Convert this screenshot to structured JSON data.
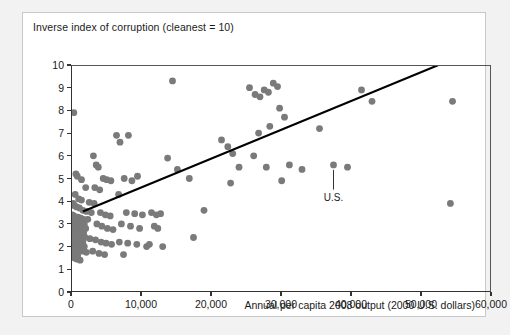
{
  "figure": {
    "title": "Inverse index of corruption (cleanest = 10)",
    "x_axis_title": "Annual per capita 2008 output (2000 U.S. dollars)"
  },
  "annotations": [
    {
      "label": "U.S.",
      "x": 37500,
      "y": 4.6,
      "point_x": 37500,
      "point_y": 5.6
    }
  ],
  "chart_data": {
    "type": "scatter",
    "title": "Inverse index of corruption (cleanest = 10)",
    "xlabel": "Annual per capita 2008 output (2000 U.S. dollars)",
    "ylabel": "Inverse index of corruption (cleanest = 10)",
    "xlim": [
      0,
      60000
    ],
    "ylim": [
      0,
      10
    ],
    "xticks": [
      0,
      10000,
      20000,
      30000,
      40000,
      50000,
      60000
    ],
    "xticklabels": [
      "0",
      "10,000",
      "20,000",
      "30,000",
      "40,000",
      "50,000",
      "60,000"
    ],
    "yticks": [
      0,
      1,
      2,
      3,
      4,
      5,
      6,
      7,
      8,
      9,
      10
    ],
    "yticklabels": [
      "0",
      "1",
      "2",
      "3",
      "4",
      "5",
      "6",
      "7",
      "8",
      "9",
      "10"
    ],
    "grid": false,
    "legend": false,
    "marker_color": "#7a7a7a",
    "marker_size": 3.4,
    "trendline": {
      "color": "#000000",
      "width": 2.1,
      "x0": 1700,
      "y0": 3.55,
      "x1": 52500,
      "y1": 10.0
    },
    "points": [
      [
        400,
        7.9
      ],
      [
        700,
        5.2
      ],
      [
        900,
        5.1
      ],
      [
        1500,
        4.95
      ],
      [
        2100,
        4.6
      ],
      [
        600,
        4.3
      ],
      [
        1100,
        4.1
      ],
      [
        1500,
        4.05
      ],
      [
        2600,
        3.95
      ],
      [
        300,
        3.9
      ],
      [
        500,
        3.8
      ],
      [
        800,
        3.75
      ],
      [
        1200,
        3.7
      ],
      [
        1700,
        3.6
      ],
      [
        2200,
        3.55
      ],
      [
        2900,
        3.5
      ],
      [
        200,
        3.4
      ],
      [
        400,
        3.35
      ],
      [
        700,
        3.3
      ],
      [
        1000,
        3.3
      ],
      [
        1400,
        3.25
      ],
      [
        1800,
        3.2
      ],
      [
        2400,
        3.2
      ],
      [
        300,
        3.1
      ],
      [
        600,
        3.1
      ],
      [
        900,
        3.05
      ],
      [
        1300,
        3.0
      ],
      [
        1900,
        3.0
      ],
      [
        250,
        2.95
      ],
      [
        550,
        2.9
      ],
      [
        800,
        2.9
      ],
      [
        1100,
        2.85
      ],
      [
        1600,
        2.8
      ],
      [
        2100,
        2.8
      ],
      [
        350,
        2.75
      ],
      [
        650,
        2.7
      ],
      [
        950,
        2.7
      ],
      [
        1250,
        2.65
      ],
      [
        1800,
        2.6
      ],
      [
        200,
        2.55
      ],
      [
        500,
        2.5
      ],
      [
        750,
        2.5
      ],
      [
        1050,
        2.45
      ],
      [
        1500,
        2.4
      ],
      [
        2000,
        2.4
      ],
      [
        2700,
        2.35
      ],
      [
        300,
        2.3
      ],
      [
        600,
        2.3
      ],
      [
        900,
        2.25
      ],
      [
        1200,
        2.2
      ],
      [
        1700,
        2.2
      ],
      [
        400,
        2.15
      ],
      [
        700,
        2.1
      ],
      [
        1000,
        2.1
      ],
      [
        1400,
        2.05
      ],
      [
        1900,
        2.0
      ],
      [
        250,
        1.95
      ],
      [
        550,
        1.9
      ],
      [
        850,
        1.9
      ],
      [
        1150,
        1.85
      ],
      [
        1600,
        1.8
      ],
      [
        2200,
        1.75
      ],
      [
        350,
        1.7
      ],
      [
        650,
        1.65
      ],
      [
        950,
        1.6
      ],
      [
        500,
        1.5
      ],
      [
        800,
        1.45
      ],
      [
        1300,
        1.4
      ],
      [
        3200,
        6.0
      ],
      [
        3600,
        5.6
      ],
      [
        3900,
        5.5
      ],
      [
        4600,
        5.0
      ],
      [
        5100,
        4.95
      ],
      [
        5700,
        4.9
      ],
      [
        3400,
        4.6
      ],
      [
        4100,
        4.5
      ],
      [
        3300,
        3.9
      ],
      [
        4200,
        3.5
      ],
      [
        4900,
        3.4
      ],
      [
        5600,
        3.35
      ],
      [
        3700,
        3.0
      ],
      [
        4400,
        2.9
      ],
      [
        5200,
        2.8
      ],
      [
        6000,
        2.75
      ],
      [
        3500,
        2.3
      ],
      [
        4300,
        2.2
      ],
      [
        5000,
        2.15
      ],
      [
        5800,
        2.1
      ],
      [
        3100,
        1.8
      ],
      [
        4000,
        1.7
      ],
      [
        4800,
        1.65
      ],
      [
        6500,
        6.9
      ],
      [
        7000,
        6.6
      ],
      [
        8200,
        6.9
      ],
      [
        7600,
        5.0
      ],
      [
        8700,
        4.9
      ],
      [
        9500,
        5.1
      ],
      [
        6800,
        4.3
      ],
      [
        7900,
        3.5
      ],
      [
        9100,
        3.45
      ],
      [
        10200,
        3.4
      ],
      [
        7200,
        3.0
      ],
      [
        8500,
        2.9
      ],
      [
        9800,
        2.8
      ],
      [
        6900,
        2.2
      ],
      [
        8100,
        2.15
      ],
      [
        9400,
        2.1
      ],
      [
        10800,
        2.0
      ],
      [
        7500,
        1.65
      ],
      [
        11500,
        3.5
      ],
      [
        12200,
        3.4
      ],
      [
        12800,
        3.45
      ],
      [
        11900,
        2.9
      ],
      [
        12400,
        2.8
      ],
      [
        11200,
        2.1
      ],
      [
        13100,
        2.0
      ],
      [
        14500,
        9.3
      ],
      [
        13800,
        5.9
      ],
      [
        15200,
        5.4
      ],
      [
        16900,
        5.0
      ],
      [
        17500,
        2.4
      ],
      [
        19000,
        3.6
      ],
      [
        21500,
        6.7
      ],
      [
        22400,
        6.4
      ],
      [
        23100,
        6.1
      ],
      [
        24000,
        5.5
      ],
      [
        22800,
        4.8
      ],
      [
        25500,
        9.0
      ],
      [
        26300,
        8.7
      ],
      [
        27000,
        8.6
      ],
      [
        27600,
        8.9
      ],
      [
        28200,
        8.8
      ],
      [
        28900,
        9.2
      ],
      [
        29500,
        9.05
      ],
      [
        26800,
        7.0
      ],
      [
        28400,
        7.3
      ],
      [
        26100,
        6.0
      ],
      [
        27900,
        5.5
      ],
      [
        29800,
        8.1
      ],
      [
        30500,
        7.7
      ],
      [
        31200,
        5.6
      ],
      [
        33000,
        5.4
      ],
      [
        30100,
        4.9
      ],
      [
        35500,
        7.2
      ],
      [
        37500,
        5.6
      ],
      [
        39500,
        5.5
      ],
      [
        41500,
        8.9
      ],
      [
        43000,
        8.4
      ],
      [
        54500,
        8.4
      ],
      [
        54200,
        3.9
      ]
    ]
  }
}
